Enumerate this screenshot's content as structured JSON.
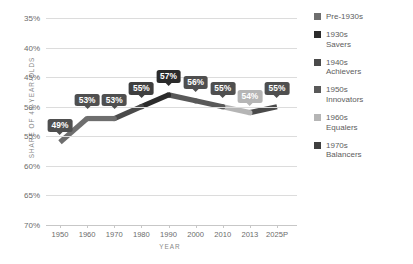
{
  "chart_data": {
    "type": "line",
    "title": "",
    "subtitle": "",
    "xlabel": "YEAR",
    "ylabel": "SHARE OF 48-YEAR-OLDS",
    "x": [
      "1950",
      "1960",
      "1970",
      "1980",
      "1990",
      "2000",
      "2010",
      "2013",
      "2025P"
    ],
    "categories": [
      "1950",
      "1960",
      "1970",
      "1980",
      "1990",
      "2000",
      "2010",
      "2013",
      "2025P"
    ],
    "values": [
      49,
      53,
      53,
      55,
      57,
      56,
      55,
      54,
      55
    ],
    "point_labels": [
      "49%",
      "53%",
      "53%",
      "55%",
      "57%",
      "56%",
      "55%",
      "54%",
      "55%"
    ],
    "ylim": [
      35,
      70
    ],
    "yticks": [
      35,
      40,
      45,
      50,
      55,
      60,
      65,
      70
    ],
    "ytick_labels": [
      "35%",
      "40%",
      "45%",
      "50%",
      "55%",
      "60%",
      "65%",
      "70%"
    ],
    "grid": true,
    "legend_position": "right",
    "series": [
      {
        "name": "Pre-1930s",
        "color": "#6e6e6e",
        "segments": [
          {
            "from": "1950",
            "to": "1960"
          },
          {
            "from": "1960",
            "to": "1970"
          }
        ]
      },
      {
        "name": "1930s Savers",
        "color": "#4a4a4a",
        "segments": [
          {
            "from": "1970",
            "to": "1980"
          }
        ]
      },
      {
        "name": "1940s Achievers",
        "color": "#2b2b2b",
        "segments": [
          {
            "from": "1980",
            "to": "1990"
          }
        ]
      },
      {
        "name": "1950s Innovators",
        "color": "#595959",
        "segments": [
          {
            "from": "1990",
            "to": "2000"
          },
          {
            "from": "2000",
            "to": "2010"
          }
        ]
      },
      {
        "name": "1960s Equalers",
        "color": "#b5b5b5",
        "segments": [
          {
            "from": "2010",
            "to": "2013"
          }
        ]
      },
      {
        "name": "1970s Balancers",
        "color": "#4a4a4a",
        "segments": [
          {
            "from": "2013",
            "to": "2025P"
          }
        ]
      }
    ]
  },
  "axes": {
    "y_title": "SHARE OF 48-YEAR-OLDS",
    "x_title": "YEAR",
    "y_tick_labels": [
      "70%",
      "65%",
      "60%",
      "55%",
      "50%",
      "45%",
      "40%",
      "35%"
    ],
    "x_tick_labels": [
      "1950",
      "1960",
      "1970",
      "1980",
      "1990",
      "2000",
      "2010",
      "2013",
      "2025P"
    ]
  },
  "callouts": [
    {
      "text": "49%",
      "bg": "#4f4f4f",
      "fg": "#ffffff"
    },
    {
      "text": "53%",
      "bg": "#4f4f4f",
      "fg": "#ffffff"
    },
    {
      "text": "53%",
      "bg": "#4f4f4f",
      "fg": "#ffffff"
    },
    {
      "text": "55%",
      "bg": "#3f3f3f",
      "fg": "#ffffff"
    },
    {
      "text": "57%",
      "bg": "#2b2b2b",
      "fg": "#ffffff"
    },
    {
      "text": "56%",
      "bg": "#4f4f4f",
      "fg": "#ffffff"
    },
    {
      "text": "55%",
      "bg": "#4f4f4f",
      "fg": "#ffffff"
    },
    {
      "text": "54%",
      "bg": "#b5b5b5",
      "fg": "#ffffff"
    },
    {
      "text": "55%",
      "bg": "#4f4f4f",
      "fg": "#ffffff"
    }
  ],
  "legend": {
    "items": [
      {
        "label": "Pre-1930s",
        "color": "#6e6e6e"
      },
      {
        "label": "1930s\nSavers",
        "color": "#2b2b2b"
      },
      {
        "label": "1940s\nAchievers",
        "color": "#4a4a4a"
      },
      {
        "label": "1950s\nInnovators",
        "color": "#595959"
      },
      {
        "label": "1960s\nEqualers",
        "color": "#b5b5b5"
      },
      {
        "label": "1970s\nBalancers",
        "color": "#3f3f3f"
      }
    ]
  },
  "colors": {
    "grid": "#dcdcdc",
    "axis": "#c7c7c7",
    "tick_text": "#6b6b6b",
    "title_text": "#888888",
    "background": "#ffffff"
  }
}
